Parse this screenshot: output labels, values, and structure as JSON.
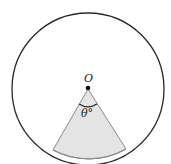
{
  "diagram": {
    "center_label": "O",
    "angle_label": "θ°",
    "colors": {
      "circle_stroke": "#2a2a2a",
      "sector_fill": "#e4e4e4",
      "sector_stroke": "#8a8a8a",
      "center_dot": "#111111"
    }
  }
}
